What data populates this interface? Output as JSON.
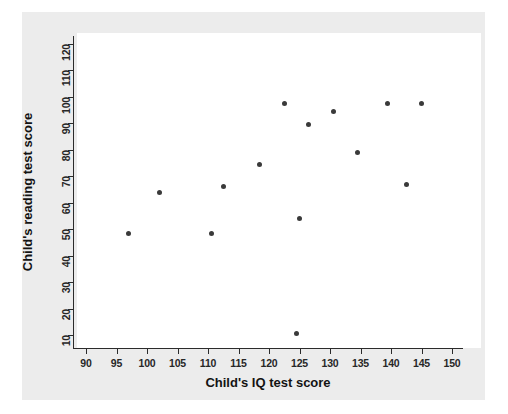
{
  "chart_data": {
    "type": "scatter",
    "title": "",
    "xlabel": "Child's IQ test score",
    "ylabel": "Child's reading test score",
    "xlim": [
      88,
      152
    ],
    "ylim": [
      6,
      124
    ],
    "xticks": [
      90,
      95,
      100,
      105,
      110,
      115,
      120,
      125,
      130,
      135,
      140,
      145,
      150
    ],
    "yticks": [
      10,
      20,
      30,
      40,
      50,
      60,
      70,
      80,
      90,
      100,
      110,
      120
    ],
    "grid": false,
    "legend": null,
    "marker_color": "#3a3a3a",
    "panel_color": "#ececec",
    "plot_background": "#ffffff",
    "points": [
      {
        "x": 97,
        "y": 48.5
      },
      {
        "x": 102,
        "y": 64
      },
      {
        "x": 110.5,
        "y": 48.5
      },
      {
        "x": 112.5,
        "y": 66
      },
      {
        "x": 118.5,
        "y": 74.5
      },
      {
        "x": 122.5,
        "y": 97.5
      },
      {
        "x": 124.5,
        "y": 10.5
      },
      {
        "x": 125,
        "y": 54
      },
      {
        "x": 126.5,
        "y": 89.5
      },
      {
        "x": 130.5,
        "y": 94.5
      },
      {
        "x": 134.5,
        "y": 79
      },
      {
        "x": 139.5,
        "y": 97.5
      },
      {
        "x": 142.5,
        "y": 67
      },
      {
        "x": 145,
        "y": 97.5
      }
    ]
  }
}
